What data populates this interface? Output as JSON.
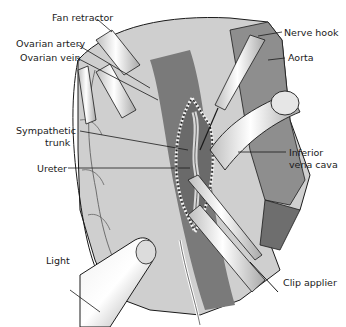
{
  "figure": {
    "type": "surgical-illustration",
    "labels": [
      {
        "id": "fan_retractor",
        "text": "Fan retractor"
      },
      {
        "id": "ovarian_artery",
        "text": "Ovarian artery"
      },
      {
        "id": "ovarian_vein",
        "text": "Ovarian vein"
      },
      {
        "id": "sympathetic_trunk_1",
        "text": "Sympathetic"
      },
      {
        "id": "sympathetic_trunk_2",
        "text": "trunk"
      },
      {
        "id": "ureter",
        "text": "Ureter"
      },
      {
        "id": "light",
        "text": "Light"
      },
      {
        "id": "nerve_hook",
        "text": "Nerve hook"
      },
      {
        "id": "aorta",
        "text": "Aorta"
      },
      {
        "id": "inferior_vena_cava_1",
        "text": "Inferior"
      },
      {
        "id": "inferior_vena_cava_2",
        "text": "vena cava"
      },
      {
        "id": "clip_applier",
        "text": "Clip applier"
      }
    ]
  },
  "colors": {
    "background": "#ffffff",
    "tissue_light": "#d4d4d4",
    "tissue_mid": "#9a9a9a",
    "tissue_dark": "#5e5e5e",
    "instrument": "#e8e8e8",
    "outline": "#1a1a1a"
  }
}
